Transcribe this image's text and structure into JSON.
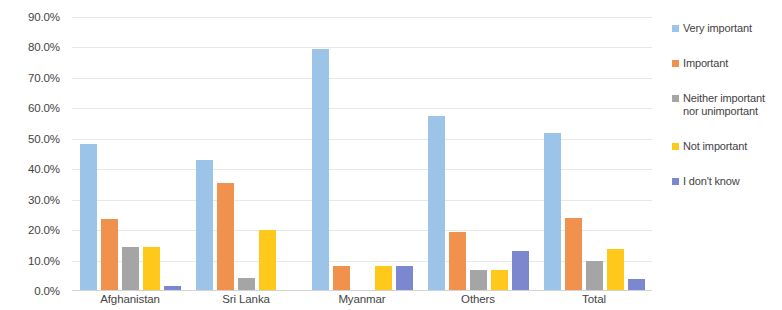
{
  "chart_data": {
    "type": "bar",
    "title": "",
    "subtitle": "",
    "xlabel": "",
    "ylabel": "",
    "categories": [
      "Afghanistan",
      "Sri Lanka",
      "Myanmar",
      "Others",
      "Total"
    ],
    "series": [
      {
        "name": "Very important",
        "color": "#9cc3e8",
        "values": [
          48.3,
          43.0,
          79.5,
          57.5,
          52.0
        ]
      },
      {
        "name": "Important",
        "color": "#f0924e",
        "values": [
          23.5,
          35.5,
          8.3,
          19.5,
          24.0
        ]
      },
      {
        "name": "Neither important nor unimportant",
        "color": "#a5a5a5",
        "values": [
          14.3,
          4.3,
          0.0,
          6.8,
          10.0
        ]
      },
      {
        "name": "Not important",
        "color": "#ffc91b",
        "values": [
          14.3,
          20.0,
          8.3,
          7.0,
          13.8
        ]
      },
      {
        "name": "I don't know",
        "color": "#7b87ce",
        "values": [
          1.7,
          0.0,
          8.3,
          13.0,
          4.0
        ]
      }
    ],
    "ytick_labels": [
      "90.0%",
      "80.0%",
      "70.0%",
      "60.0%",
      "50.0%",
      "40.0%",
      "30.0%",
      "20.0%",
      "10.0%",
      "0.0%"
    ],
    "ytick_values": [
      90,
      80,
      70,
      60,
      50,
      40,
      30,
      20,
      10,
      0
    ],
    "ylim": [
      0,
      90
    ],
    "grid": true,
    "legend_position": "right"
  }
}
